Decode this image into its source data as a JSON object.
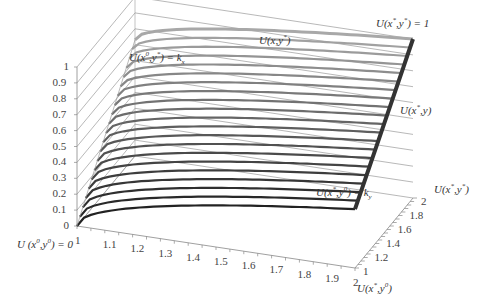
{
  "chart_data": {
    "type": "surface3d",
    "title": "",
    "x_axis": {
      "label": "x",
      "range": [
        1,
        2
      ],
      "ticks": [
        "1",
        "1.1",
        "1.2",
        "1.3",
        "1.4",
        "1.5",
        "1.6",
        "1.7",
        "1.8",
        "1.9",
        "2"
      ]
    },
    "y_axis": {
      "label": "y",
      "range": [
        1,
        2
      ],
      "ticks": [
        "1",
        "1.2",
        "1.4",
        "1.6",
        "1.8",
        "2"
      ]
    },
    "z_axis": {
      "label": "U",
      "range": [
        0,
        1
      ],
      "ticks": [
        "0",
        "0.1",
        "0.2",
        "0.3",
        "0.4",
        "0.5",
        "0.6",
        "0.7",
        "0.8",
        "0.9",
        "1"
      ]
    },
    "grid": true,
    "series_note": "Constant-y slices of U(x,y) from y=1 (front, dark) to y=2 (back, gray)",
    "corner_values": {
      "U(x0,y0)": 0,
      "U(x0,y*)": 0.73,
      "U(x*,y0)": 0.37,
      "U(x*,y*)": 1
    },
    "slices_y": [
      1.0,
      1.05,
      1.1,
      1.15,
      1.2,
      1.25,
      1.3,
      1.35,
      1.4,
      1.45,
      1.5,
      1.55,
      1.6,
      1.65,
      1.7,
      1.75,
      1.8,
      1.85,
      1.9,
      1.95,
      2.0
    ],
    "colors": {
      "front": "#222222",
      "back": "#a8a8a8",
      "edge_dark": "#333333",
      "grid": "#9a9a9a",
      "axis": "#888888"
    }
  },
  "annotations": {
    "u_x0_ystar": {
      "pre": "U(x",
      "sup1": "0",
      "mid": ",y",
      "sup2": "*",
      "post": ") = k",
      "sub": "x"
    },
    "u_x_ystar": {
      "pre": "U(x,y",
      "sup1": "*",
      "post": ")"
    },
    "u_xstar_ystar_1": {
      "pre": "U(x",
      "sup1": "*",
      "mid": ",y",
      "sup2": "*",
      "post": ") = 1"
    },
    "u_xstar_y": {
      "pre": "U(x",
      "sup1": "*",
      "post": ",y)"
    },
    "u_xstar_y0_ky": {
      "pre": "U(x",
      "sup1": "*",
      "mid": ",y",
      "sup2": "0",
      "post": ") = k",
      "sub": "y"
    },
    "u_x0_y0_0": {
      "pre": "U (x",
      "sup1": "0",
      "mid": ",y",
      "sup2": "0",
      "post": ") = 0"
    },
    "u_xstar_ystar_axis": {
      "pre": "U(x",
      "sup1": "*",
      "mid": ",y",
      "sup2": "*",
      "post": ")"
    },
    "u_xstar_y0_axis": {
      "pre": "U(x",
      "sup1": "*",
      "mid": ",y",
      "sup2": "0",
      "post": ")"
    }
  }
}
